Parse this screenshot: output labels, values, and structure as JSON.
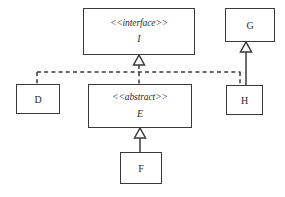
{
  "diagram": {
    "type": "uml-class-diagram",
    "width": 285,
    "height": 197,
    "background_color": "#ffffff",
    "line_color": "#3a3a3a",
    "text_color": "#2b2b2b",
    "classes": [
      {
        "id": "I",
        "name": "I",
        "stereotype": "<<interface>>",
        "kind": "interface",
        "name_italic": true,
        "x": 83,
        "y": 8,
        "width": 112,
        "height": 47
      },
      {
        "id": "G",
        "name": "G",
        "stereotype": "",
        "kind": "class",
        "name_italic": false,
        "x": 225,
        "y": 8,
        "width": 50,
        "height": 34
      },
      {
        "id": "D",
        "name": "D",
        "stereotype": "",
        "kind": "class",
        "name_italic": false,
        "x": 16,
        "y": 84,
        "width": 44,
        "height": 30
      },
      {
        "id": "E",
        "name": "E",
        "stereotype": "<<abstract>>",
        "kind": "abstract",
        "name_italic": true,
        "x": 88,
        "y": 84,
        "width": 104,
        "height": 44
      },
      {
        "id": "H",
        "name": "H",
        "stereotype": "",
        "kind": "class",
        "name_italic": false,
        "x": 226,
        "y": 85,
        "width": 37,
        "height": 30
      },
      {
        "id": "F",
        "name": "F",
        "stereotype": "",
        "kind": "class",
        "name_italic": false,
        "x": 120,
        "y": 152,
        "width": 42,
        "height": 32
      }
    ],
    "relationships": [
      {
        "id": "rel-e-i",
        "from": "E",
        "to": "I",
        "type": "realization",
        "line": "dashed",
        "arrowhead": "hollow-triangle"
      },
      {
        "id": "rel-d-i",
        "from": "D",
        "to": "I",
        "type": "realization",
        "line": "dashed",
        "arrowhead": "shared-hollow-triangle"
      },
      {
        "id": "rel-h-i",
        "from": "H",
        "to": "I",
        "type": "realization",
        "line": "dashed",
        "arrowhead": "shared-hollow-triangle"
      },
      {
        "id": "rel-f-e",
        "from": "F",
        "to": "E",
        "type": "generalization",
        "line": "solid",
        "arrowhead": "hollow-triangle"
      },
      {
        "id": "rel-h-g",
        "from": "H",
        "to": "G",
        "type": "generalization",
        "line": "solid",
        "arrowhead": "hollow-triangle"
      }
    ]
  }
}
